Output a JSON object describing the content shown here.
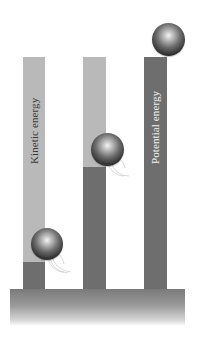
{
  "diagram": {
    "title": "",
    "labels": {
      "kinetic": "Kinetic energy",
      "potential": "Potential energy"
    },
    "colors": {
      "kinetic_light": "#b9b9b9",
      "potential_dark": "#6e6e6e",
      "ground_top": "#7a7a7a",
      "background": "#ffffff"
    },
    "columns": [
      {
        "id": "left",
        "kinetic_fraction": 0.88,
        "potential_fraction": 0.12,
        "ball": "bottom",
        "motion_lines": true
      },
      {
        "id": "middle",
        "kinetic_fraction": 0.47,
        "potential_fraction": 0.53,
        "ball": "middle",
        "motion_lines": true
      },
      {
        "id": "right",
        "kinetic_fraction": 0.0,
        "potential_fraction": 1.0,
        "ball": "top",
        "motion_lines": false
      }
    ]
  }
}
